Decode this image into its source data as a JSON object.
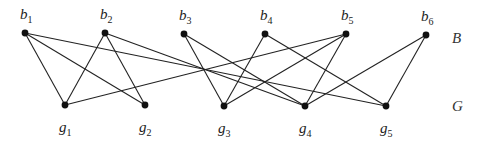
{
  "graph": {
    "type": "bipartite",
    "top_set_label": "B",
    "bottom_set_label": "G",
    "top_nodes": [
      {
        "id": "b1",
        "base": "b",
        "sub": "1",
        "x": 25,
        "y": 33
      },
      {
        "id": "b2",
        "base": "b",
        "sub": "2",
        "x": 105,
        "y": 33
      },
      {
        "id": "b3",
        "base": "b",
        "sub": "3",
        "x": 184,
        "y": 34
      },
      {
        "id": "b4",
        "base": "b",
        "sub": "4",
        "x": 265,
        "y": 34
      },
      {
        "id": "b5",
        "base": "b",
        "sub": "5",
        "x": 346,
        "y": 34
      },
      {
        "id": "b6",
        "base": "b",
        "sub": "6",
        "x": 426,
        "y": 35
      }
    ],
    "bottom_nodes": [
      {
        "id": "g1",
        "base": "g",
        "sub": "1",
        "x": 65,
        "y": 105
      },
      {
        "id": "g2",
        "base": "g",
        "sub": "2",
        "x": 145,
        "y": 105
      },
      {
        "id": "g3",
        "base": "g",
        "sub": "3",
        "x": 224,
        "y": 106
      },
      {
        "id": "g4",
        "base": "g",
        "sub": "4",
        "x": 305,
        "y": 106
      },
      {
        "id": "g5",
        "base": "g",
        "sub": "5",
        "x": 386,
        "y": 106
      }
    ],
    "edges": [
      [
        "b1",
        "g1"
      ],
      [
        "b1",
        "g2"
      ],
      [
        "b1",
        "g5"
      ],
      [
        "b2",
        "g1"
      ],
      [
        "b2",
        "g2"
      ],
      [
        "b2",
        "g4"
      ],
      [
        "b3",
        "g3"
      ],
      [
        "b3",
        "g4"
      ],
      [
        "b4",
        "g3"
      ],
      [
        "b4",
        "g5"
      ],
      [
        "b5",
        "g1"
      ],
      [
        "b5",
        "g3"
      ],
      [
        "b5",
        "g4"
      ],
      [
        "b6",
        "g4"
      ],
      [
        "b6",
        "g5"
      ]
    ],
    "side_labels": {
      "B": {
        "x": 452,
        "y": 43
      },
      "G": {
        "x": 452,
        "y": 111
      }
    }
  }
}
